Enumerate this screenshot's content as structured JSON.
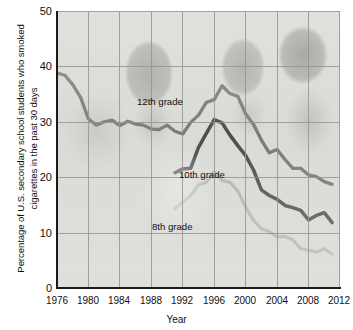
{
  "chart_data": {
    "type": "line",
    "title": "",
    "xlabel": "Year",
    "ylabel": "Percentage of U.S. secondary school students who smoked cigarettes in the past 30 days",
    "xlim": [
      1976,
      2012
    ],
    "ylim": [
      0,
      50
    ],
    "xticks": [
      "1976",
      "1980",
      "1984",
      "1988",
      "1992",
      "1996",
      "2000",
      "2004",
      "2008",
      "2012"
    ],
    "yticks": [
      "0",
      "10",
      "20",
      "30",
      "40",
      "50"
    ],
    "grid": true,
    "legend_position": "inline-annotations",
    "series": [
      {
        "name": "12th grade",
        "color": "#5a5a58",
        "x": [
          1976,
          1977,
          1978,
          1979,
          1980,
          1981,
          1982,
          1983,
          1984,
          1985,
          1986,
          1987,
          1988,
          1989,
          1990,
          1991,
          1992,
          1993,
          1994,
          1995,
          1996,
          1997,
          1998,
          1999,
          2000,
          2001,
          2002,
          2003,
          2004,
          2005,
          2006,
          2007,
          2008,
          2009,
          2010,
          2011
        ],
        "values": [
          38.8,
          38.4,
          36.7,
          34.4,
          30.5,
          29.4,
          30.0,
          30.3,
          29.3,
          30.1,
          29.6,
          29.4,
          28.7,
          28.6,
          29.4,
          28.3,
          27.8,
          29.9,
          31.2,
          33.5,
          34.0,
          36.5,
          35.1,
          34.6,
          31.4,
          29.5,
          26.7,
          24.4,
          25.0,
          23.2,
          21.6,
          21.6,
          20.4,
          20.1,
          19.2,
          18.7
        ]
      },
      {
        "name": "10th grade",
        "color": "#1f1f1f",
        "x": [
          1991,
          1992,
          1993,
          1994,
          1995,
          1996,
          1997,
          1998,
          1999,
          2000,
          2001,
          2002,
          2003,
          2004,
          2005,
          2006,
          2007,
          2008,
          2009,
          2010,
          2011
        ],
        "values": [
          20.8,
          21.5,
          21.6,
          25.4,
          27.9,
          30.4,
          29.8,
          27.6,
          25.7,
          23.9,
          21.3,
          17.7,
          16.7,
          16.0,
          14.9,
          14.5,
          14.0,
          12.3,
          13.1,
          13.6,
          11.8
        ]
      },
      {
        "name": "8th grade",
        "color": "#a9a9a6",
        "x": [
          1991,
          1992,
          1993,
          1994,
          1995,
          1996,
          1997,
          1998,
          1999,
          2000,
          2001,
          2002,
          2003,
          2004,
          2005,
          2006,
          2007,
          2008,
          2009,
          2010,
          2011
        ],
        "values": [
          14.3,
          15.5,
          16.7,
          18.6,
          19.1,
          21.0,
          19.4,
          19.1,
          17.5,
          14.6,
          12.2,
          10.7,
          10.2,
          9.2,
          9.3,
          8.7,
          7.1,
          6.8,
          6.5,
          7.1,
          6.1
        ]
      }
    ],
    "annotations": [
      {
        "label": "12th grade"
      },
      {
        "label": "10th grade"
      },
      {
        "label": "8th grade"
      }
    ]
  },
  "axis": {
    "x_title": "Year",
    "y_title": "Percentage of U.S. secondary school students who smoked cigarettes in the past 30 days"
  },
  "labels": {
    "grade12": "12th grade",
    "grade10": "10th grade",
    "grade8": "8th grade"
  },
  "yticks": {
    "t0": "0",
    "t10": "10",
    "t20": "20",
    "t30": "30",
    "t40": "40",
    "t50": "50"
  },
  "xticks": {
    "t1976": "1976",
    "t1980": "1980",
    "t1984": "1984",
    "t1988": "1988",
    "t1992": "1992",
    "t1996": "1996",
    "t2000": "2000",
    "t2004": "2004",
    "t2008": "2008",
    "t2012": "2012"
  },
  "colors": {
    "grade12": "#5a5a58",
    "grade10": "#1f1f1f",
    "grade8": "#a9a9a6",
    "plot_background": "#dcdcd9",
    "gridline": "#96948f",
    "axis": "#1a1a1a"
  }
}
